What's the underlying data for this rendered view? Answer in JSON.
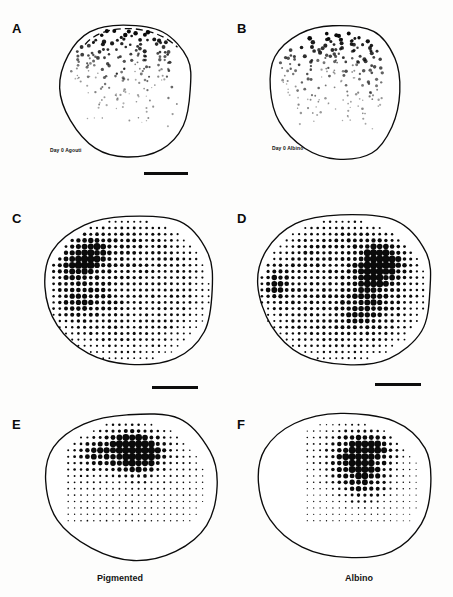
{
  "figure": {
    "background_color": "#fdfdfc",
    "ink_color": "#0a0a0a",
    "width": 453,
    "height": 597
  },
  "panels": [
    {
      "letter": "A",
      "letter_x": 12,
      "letter_y": 22,
      "inset_label": "Day 0 Agouti",
      "inset_label_x": 50,
      "inset_label_y": 148,
      "map_type": "scatter",
      "origin_x": 55,
      "origin_y": 20,
      "map_width": 140,
      "map_height": 140,
      "has_dashed_top": true
    },
    {
      "letter": "B",
      "letter_x": 237,
      "letter_y": 22,
      "inset_label": "Day 0 Albino",
      "inset_label_x": 272,
      "inset_label_y": 146,
      "map_type": "scatter",
      "origin_x": 264,
      "origin_y": 22,
      "map_width": 140,
      "map_height": 140,
      "has_dashed_top": false
    },
    {
      "letter": "C",
      "letter_x": 12,
      "letter_y": 212,
      "inset_label": "",
      "map_type": "grid",
      "origin_x": 38,
      "origin_y": 210,
      "map_width": 180,
      "map_height": 160,
      "has_dashed_top": false
    },
    {
      "letter": "D",
      "letter_x": 237,
      "letter_y": 212,
      "inset_label": "",
      "map_type": "grid",
      "origin_x": 250,
      "origin_y": 210,
      "map_width": 185,
      "map_height": 160,
      "has_dashed_top": false
    },
    {
      "letter": "E",
      "letter_x": 12,
      "letter_y": 418,
      "inset_label": "",
      "map_type": "grid",
      "origin_x": 38,
      "origin_y": 408,
      "map_width": 182,
      "map_height": 155,
      "has_dashed_top": false
    },
    {
      "letter": "F",
      "letter_x": 237,
      "letter_y": 418,
      "inset_label": "",
      "map_type": "grid",
      "origin_x": 250,
      "origin_y": 408,
      "map_width": 185,
      "map_height": 155,
      "has_dashed_top": false
    }
  ],
  "scale_bars": [
    {
      "name": "scalebar-panel-a",
      "x": 144,
      "y": 172,
      "width": 44
    },
    {
      "name": "scalebar-panel-c",
      "x": 152,
      "y": 386,
      "width": 46
    },
    {
      "name": "scalebar-panel-d",
      "x": 375,
      "y": 383,
      "width": 46
    }
  ],
  "captions": [
    {
      "name": "caption-pigmented",
      "text": "Pigmented",
      "x": 97,
      "y": 573
    },
    {
      "name": "caption-albino",
      "text": "Albino",
      "x": 345,
      "y": 573
    }
  ],
  "chart_data": {
    "type": "scatter",
    "xlabel": "",
    "ylabel": "",
    "dot_diameter_encoding": "Dot area is proportional to local cell density; diameters run from about 1 px (lowest density) to about 7 px (highest density).",
    "grid_spacing_px": 6.2,
    "columns": [
      "Pigmented",
      "Albino"
    ],
    "rows": [
      "Day 0",
      "Mature density map",
      "Peak density map"
    ],
    "series": [
      {
        "name": "A — Day 0 Agouti",
        "panel": "A",
        "group": "Pigmented",
        "style": "scatter",
        "n_points": 196,
        "gradient": "superior-to-inferior decreasing",
        "peak_region": "superior margin",
        "notes": "Dashed superior margin indicates incomplete or cut edge of the whole mount."
      },
      {
        "name": "B — Day 0 Albino",
        "panel": "B",
        "group": "Albino",
        "style": "scatter",
        "n_points": 186,
        "gradient": "superior-to-inferior decreasing",
        "peak_region": "superior-central",
        "notes": "Comparable superior band of labelled cells to panel A."
      },
      {
        "name": "C — Pigmented density lattice",
        "panel": "C",
        "group": "Pigmented",
        "style": "grid",
        "lattice_cols": 26,
        "lattice_rows": 23,
        "peak_region": "upper-left / naso-superior",
        "peak_relative_density": 1.0,
        "mean_relative_density": 0.55,
        "notes": "Whole retina sampled; largest dots form a compact patch in the upper-left quadrant."
      },
      {
        "name": "D — Albino density lattice",
        "panel": "D",
        "group": "Albino",
        "style": "grid",
        "lattice_cols": 26,
        "lattice_rows": 23,
        "peak_region": "upper-right / temporo-superior",
        "peak_relative_density": 1.0,
        "mean_relative_density": 0.55,
        "notes": "Largest dots concentrate right of centre, with a secondary patch at the left margin."
      },
      {
        "name": "E — Pigmented peak density lattice",
        "panel": "E",
        "group": "Pigmented",
        "style": "grid",
        "lattice_cols": 24,
        "lattice_rows": 20,
        "peak_region": "superior-central, slightly temporal",
        "peak_relative_density": 1.0,
        "mean_relative_density": 0.38,
        "notes": "Sampling restricted to the dorsal two thirds; inferior retina sparsely sampled."
      },
      {
        "name": "F — Albino peak density lattice",
        "panel": "F",
        "group": "Albino",
        "style": "grid",
        "lattice_cols": 24,
        "lattice_rows": 20,
        "peak_region": "central, displaced temporally",
        "peak_relative_density": 0.92,
        "mean_relative_density": 0.33,
        "notes": "Lattice covers a smaller, more temporally placed field than panel E."
      }
    ]
  }
}
